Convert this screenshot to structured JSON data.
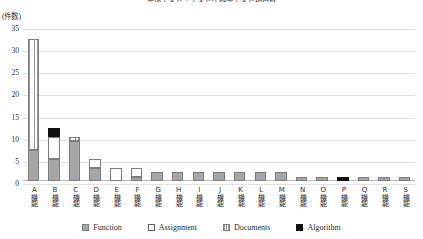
{
  "chart_data": {
    "type": "bar",
    "title": "単体テスト・テスト仕様書テスト項目数",
    "subtitle": "",
    "unit_label": "(件数)",
    "xlabel": "",
    "ylabel": "",
    "ylim": [
      0,
      35
    ],
    "yticks": [
      0,
      5,
      10,
      15,
      20,
      25,
      30,
      35
    ],
    "grid": true,
    "stacked": true,
    "legend_position": "bottom",
    "categories": [
      "A機能",
      "B機能",
      "C機能",
      "D機能",
      "E機能",
      "F機能",
      "G機能",
      "H機能",
      "I機能",
      "J機能",
      "K機能",
      "L機能",
      "M機能",
      "N機能",
      "O機能",
      "P機能",
      "Q機能",
      "R機能",
      "S機能"
    ],
    "series": [
      {
        "name": "Function",
        "color": "#a6a6a6",
        "pattern": "solid",
        "values": [
          7,
          5,
          9,
          3,
          0,
          1,
          2,
          2,
          2,
          2,
          2,
          2,
          2,
          1,
          1,
          0,
          1,
          1,
          1
        ]
      },
      {
        "name": "Assignment",
        "color": "#ffffff",
        "pattern": "empty",
        "values": [
          0,
          5,
          0,
          2,
          3,
          2,
          0,
          0,
          0,
          0,
          0,
          0,
          0,
          0,
          0,
          0,
          0,
          0,
          0
        ]
      },
      {
        "name": "Documents",
        "color": "#ffffff",
        "pattern": "vertical-stripes",
        "values": [
          25,
          0,
          1,
          0,
          0,
          0,
          0,
          0,
          0,
          0,
          0,
          0,
          0,
          0,
          0,
          0,
          0,
          0,
          0
        ]
      },
      {
        "name": "Algorithm",
        "color": "#111111",
        "pattern": "solid",
        "values": [
          0,
          2,
          0,
          0,
          0,
          0,
          0,
          0,
          0,
          0,
          0,
          0,
          0,
          0,
          0,
          1,
          0,
          0,
          0
        ]
      }
    ],
    "totals": [
      32,
      12,
      10,
      5,
      3,
      3,
      2,
      2,
      2,
      2,
      2,
      2,
      2,
      1,
      1,
      1,
      1,
      1,
      1
    ]
  },
  "legend": {
    "items": [
      {
        "label": "Function"
      },
      {
        "label": "Assignment"
      },
      {
        "label": "Documents"
      },
      {
        "label": "Algorithm"
      }
    ]
  }
}
